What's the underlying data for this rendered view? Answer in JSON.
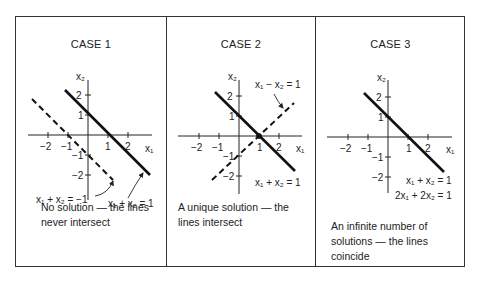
{
  "figure": {
    "panels": [
      {
        "title": "CASE 1",
        "caption_line1": "No solution — the lines",
        "caption_line2": "never intersect",
        "equations": [
          {
            "label": "x₁ + x₂ = −1",
            "style": "dashed",
            "a": 1,
            "b": 1,
            "c": -1
          },
          {
            "label": "x₁ + x₂ = 1",
            "style": "solid",
            "a": 1,
            "b": 1,
            "c": 1
          }
        ]
      },
      {
        "title": "CASE 2",
        "caption_line1": "A unique solution — the",
        "caption_line2": "lines intersect",
        "equations": [
          {
            "label": "x₁ − x₂ = 1",
            "style": "dashed",
            "a": 1,
            "b": -1,
            "c": 1
          },
          {
            "label": "x₁ + x₂ = 1",
            "style": "solid",
            "a": 1,
            "b": 1,
            "c": 1
          }
        ]
      },
      {
        "title": "CASE 3",
        "caption_line1": "An infinite number of",
        "caption_line2": "solutions — the lines",
        "caption_line3": "coincide",
        "equations": [
          {
            "label": "x₁ + x₂ = 1",
            "style": "solid",
            "a": 1,
            "b": 1,
            "c": 1
          },
          {
            "label": "2x₁ + 2x₂ = 1",
            "style": "solid",
            "a": 2,
            "b": 2,
            "c": 1
          }
        ]
      }
    ],
    "axes": {
      "x_label": "x₁",
      "y_label": "x₂",
      "x_ticks": [
        "−2",
        "−1",
        "1",
        "2"
      ],
      "y_ticks": [
        "2",
        "1",
        "−1",
        "−2"
      ]
    }
  }
}
